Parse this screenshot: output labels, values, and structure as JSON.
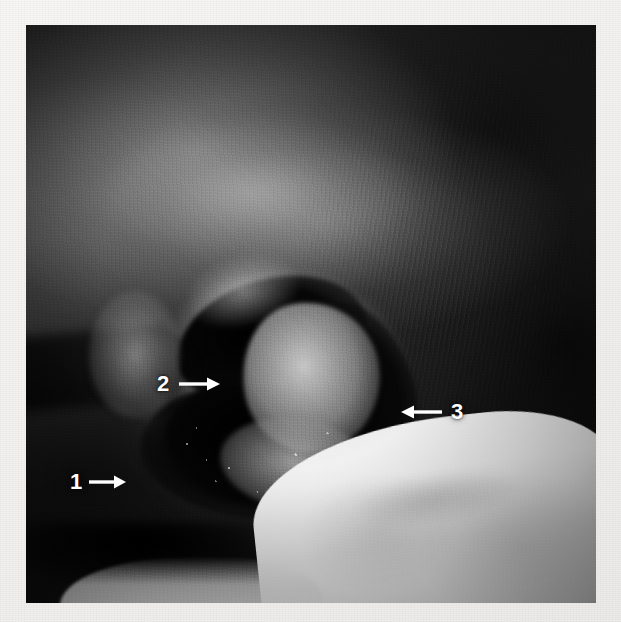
{
  "figure": {
    "type": "clinical-photograph",
    "modality": "grayscale photograph",
    "width_px": 621,
    "height_px": 622,
    "background_color": "#f4f3f1",
    "photo_border_color": "#ffffff"
  },
  "annotations": {
    "color": "#ffffff",
    "items": [
      {
        "id": "annotation-1",
        "label": "1",
        "arrow_direction": "right",
        "arrow_glyph": "→",
        "position": {
          "x": 70,
          "y": 471
        }
      },
      {
        "id": "annotation-2",
        "label": "2",
        "arrow_direction": "right",
        "arrow_glyph": "→",
        "position": {
          "x": 157,
          "y": 373
        }
      },
      {
        "id": "annotation-3",
        "label": "3",
        "arrow_direction": "left",
        "arrow_glyph": "←",
        "position": {
          "x": 400,
          "y": 401
        }
      }
    ]
  },
  "photo_regions": {
    "upper_skin": "dark mottled skin with broad diffuse specular highlight band",
    "right_skin": "dark shadowed skin with fine vertical striations",
    "wound_center": "irregular ulcer with black necrotic eschar and pale slough/granulation islands",
    "wound_margin": "raised pale rolled wound edge",
    "lower_right": "white surgical drape with soft folds",
    "lower_left": "dark limb silhouette over white drape edge"
  }
}
